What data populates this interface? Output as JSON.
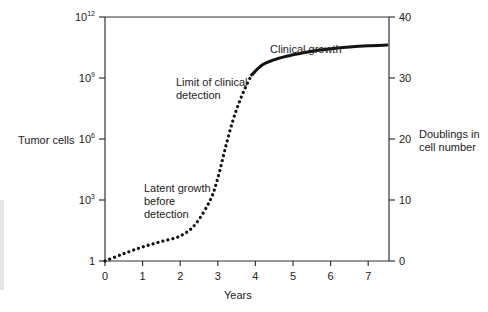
{
  "chart_data": {
    "type": "line",
    "title": "",
    "xlabel": "Years",
    "ylabel_left": "Tumor cells",
    "ylabel_right": "Doublings in cell number",
    "xlim": [
      0,
      7.5
    ],
    "ylim_doublings": [
      0,
      40
    ],
    "x_ticks": [
      "0",
      "1",
      "2",
      "3",
      "4",
      "5",
      "6",
      "7"
    ],
    "y_left_ticks": [
      {
        "base": "1",
        "exp": "",
        "doublings": 0
      },
      {
        "base": "10",
        "exp": "3",
        "doublings": 10
      },
      {
        "base": "10",
        "exp": "6",
        "doublings": 20
      },
      {
        "base": "10",
        "exp": "9",
        "doublings": 30
      },
      {
        "base": "10",
        "exp": "12",
        "doublings": 40
      }
    ],
    "y_right_ticks": [
      "0",
      "10",
      "20",
      "30",
      "40"
    ],
    "grid": false,
    "series": [
      {
        "name": "Tumor growth (dotted, pre-detection)",
        "style": "dotted",
        "x": [
          0,
          0.5,
          1,
          1.5,
          2,
          2.4,
          2.8,
          3.0,
          3.2,
          3.4,
          3.6,
          3.8,
          3.9
        ],
        "doublings": [
          0,
          1.2,
          2.3,
          3.2,
          4.1,
          6.0,
          10.0,
          13.6,
          18.5,
          23.0,
          26.5,
          29.3,
          30.5
        ]
      },
      {
        "name": "Clinical growth (solid)",
        "style": "solid",
        "x": [
          3.9,
          4.2,
          4.6,
          5.0,
          5.5,
          6.0,
          6.5,
          7.0,
          7.5
        ],
        "doublings": [
          30.5,
          32.2,
          33.2,
          33.8,
          34.4,
          34.8,
          35.1,
          35.3,
          35.4
        ]
      }
    ],
    "annotations": [
      {
        "text": "Clinical growth",
        "x": 4.3,
        "doublings": 35.5
      },
      {
        "text": "Limit of clinical\ndetection",
        "x": 2.5,
        "doublings": 30.8
      },
      {
        "text": "Latent growth\nbefore\ndetection",
        "x": 1.6,
        "doublings": 9.5
      }
    ]
  },
  "labels": {
    "x_axis_title": "Years",
    "left_axis_title": "Tumor cells",
    "right_axis_title_line1": "Doublings in",
    "right_axis_title_line2": "cell number",
    "ann_clinical": "Clinical growth",
    "ann_limit_1": "Limit of clinical",
    "ann_limit_2": "detection",
    "ann_latent_1": "Latent growth",
    "ann_latent_2": "before",
    "ann_latent_3": "detection"
  }
}
